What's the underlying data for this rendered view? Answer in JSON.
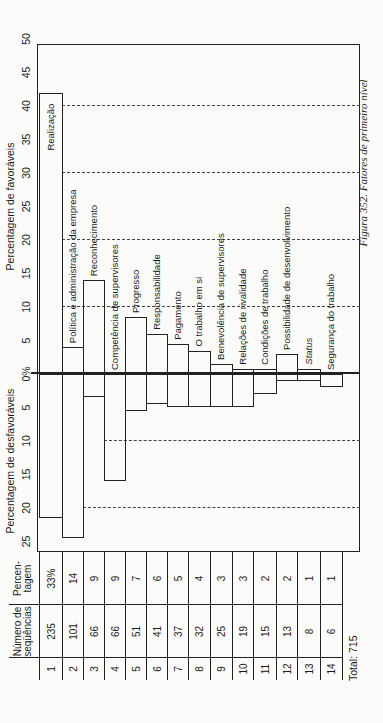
{
  "chart_data": {
    "type": "bar",
    "orientation": "diverging, printed rotated 90° counter-clockwise",
    "title": "Figura 352. Fatores de primeiro nível",
    "favorable_axis": {
      "label": "Percentagem de favoráveis",
      "ticks": [
        "0%",
        "5",
        "10",
        "15",
        "20",
        "25",
        "30",
        "35",
        "40",
        "45",
        "50"
      ],
      "range": [
        0,
        50
      ],
      "dashed_gridlines": [
        10,
        20,
        30,
        40
      ]
    },
    "unfavorable_axis": {
      "label": "Percentagem de desfavoráveis",
      "ticks": [
        "5",
        "10",
        "15",
        "20",
        "25"
      ],
      "range": [
        0,
        25
      ],
      "dashed_gridlines": [
        10,
        20
      ]
    },
    "categories": [
      "Realização",
      "Política e administração da empresa",
      "Reconhecimento",
      "Competência de supervisores",
      "Progresso",
      "Responsabilidade",
      "Pagamento",
      "O trabalho em si",
      "Benevolência de supervisores",
      "Relações de rivalidade",
      "Condições de trabalho",
      "Possibilidade de desenvolvimento",
      "Status",
      "Segurança do trabalho"
    ],
    "series": [
      {
        "name": "Percentagem de favoráveis",
        "values": [
          42,
          4,
          14,
          0,
          8.5,
          6,
          4.5,
          3.5,
          1.5,
          0.8,
          0.8,
          3,
          0.8,
          0
        ]
      },
      {
        "name": "Percentagem de desfavoráveis",
        "values": [
          21.5,
          24.5,
          3.5,
          16,
          5.5,
          4.5,
          5,
          5,
          5,
          5,
          3,
          1,
          1,
          2
        ]
      }
    ],
    "grid": "dashed reference lines",
    "legend": "none"
  },
  "table": {
    "headers": {
      "index": "",
      "count": "Número de seqüências",
      "percent": "Percen-tagem"
    },
    "count_header_lines": [
      "Número de",
      "seqüências"
    ],
    "percent_header_lines": [
      "Percen-",
      "tagem"
    ],
    "rows": [
      {
        "index": "1",
        "count": "235",
        "percent": "33%"
      },
      {
        "index": "2",
        "count": "101",
        "percent": "14"
      },
      {
        "index": "3",
        "count": "66",
        "percent": "9"
      },
      {
        "index": "4",
        "count": "66",
        "percent": "9"
      },
      {
        "index": "5",
        "count": "51",
        "percent": "7"
      },
      {
        "index": "6",
        "count": "41",
        "percent": "6"
      },
      {
        "index": "7",
        "count": "37",
        "percent": "5"
      },
      {
        "index": "8",
        "count": "32",
        "percent": "4"
      },
      {
        "index": "9",
        "count": "25",
        "percent": "3"
      },
      {
        "index": "10",
        "count": "19",
        "percent": "3"
      },
      {
        "index": "11",
        "count": "15",
        "percent": "2"
      },
      {
        "index": "12",
        "count": "13",
        "percent": "2"
      },
      {
        "index": "13",
        "count": "8",
        "percent": "1"
      },
      {
        "index": "14",
        "count": "6",
        "percent": "1"
      }
    ],
    "total": "Total: 715"
  },
  "caption": "Figura 352. Fatores de primeiro nível",
  "colors": {
    "ink": "#222222",
    "paper": "#fbfbf9"
  }
}
